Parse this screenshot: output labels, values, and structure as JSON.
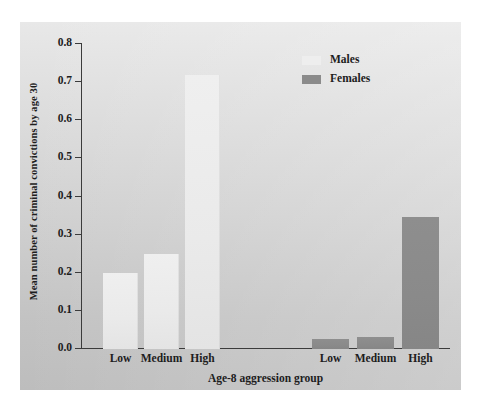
{
  "chart_data": {
    "type": "bar",
    "title": "",
    "subtitle": "",
    "xlabel": "Age-8 aggression group",
    "ylabel": "Mean number of criminal convictions by age 30",
    "categories": [
      "Low",
      "Medium",
      "High"
    ],
    "series": [
      {
        "name": "Males",
        "values": [
          0.2,
          0.25,
          0.72
        ],
        "color": "#eeeeee"
      },
      {
        "name": "Females",
        "values": [
          0.026,
          0.031,
          0.345
        ],
        "color": "#8b8b8b"
      }
    ],
    "ylim": [
      0.0,
      0.8
    ],
    "ytick_labels": [
      "0.0",
      "0.1",
      "0.2",
      "0.3",
      "0.4",
      "0.5",
      "0.6",
      "0.7",
      "0.8"
    ],
    "ytick_values": [
      0.0,
      0.1,
      0.2,
      0.3,
      0.4,
      0.5,
      0.6,
      0.7,
      0.8
    ],
    "grid": false,
    "legend_position": "top-right",
    "panel_background": "#d2d2d2",
    "axis_color": "#3b3b3b"
  },
  "legend": {
    "items": [
      {
        "label": "Males",
        "color": "#eeeeee"
      },
      {
        "label": "Females",
        "color": "#8b8b8b"
      }
    ]
  },
  "axes": {
    "y_title": "Mean number of criminal convictions by age 30",
    "x_title": "Age-8 aggression group",
    "y_ticks": [
      "0.8",
      "0.7",
      "0.6",
      "0.5",
      "0.4",
      "0.3",
      "0.2",
      "0.1",
      "0.0"
    ],
    "x_ticks": [
      "Low",
      "Medium",
      "High",
      "Low",
      "Medium",
      "High"
    ]
  }
}
